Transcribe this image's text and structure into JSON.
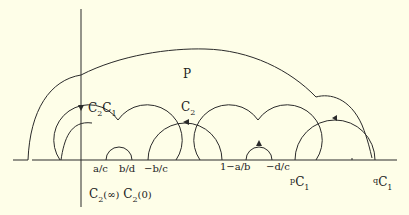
{
  "diagram": {
    "region_label": "P",
    "curve_labels": {
      "c2c1": {
        "c": "C",
        "s1": "2",
        "c2": "C",
        "s2": "1"
      },
      "c2": {
        "c": "C",
        "s": "2"
      },
      "pc1": {
        "p": "p",
        "c": "C",
        "s": "1"
      },
      "qc1": {
        "q": "q",
        "c": "C",
        "s": "1"
      }
    },
    "axis_labels": [
      "a/c",
      "b/d",
      "−b/c",
      "1−a/b",
      "−d/c"
    ],
    "bottom_label": {
      "c1": "C",
      "s1": "2",
      "a1": "(∞)",
      "c2": "C",
      "s2": "2",
      "a2": "(0)"
    },
    "stroke_color": "#2a2a2a",
    "background": "#fefee8"
  }
}
